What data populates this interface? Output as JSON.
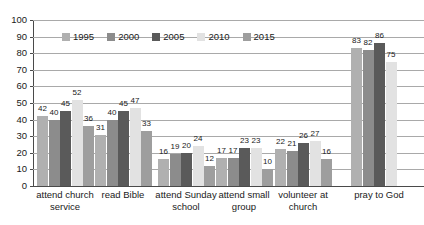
{
  "chart_data": {
    "type": "bar",
    "title": "",
    "subtitle": "",
    "xlabel": "",
    "ylabel": "",
    "ylim": [
      0,
      100
    ],
    "ytick_step": 10,
    "yticks": [
      "100",
      "90",
      "80",
      "70",
      "60",
      "50",
      "40",
      "30",
      "20",
      "10",
      "0"
    ],
    "grid": true,
    "legend_position": "top-inside-left",
    "categories": [
      "attend church service",
      "read Bible",
      "attend Sunday school",
      "attend small group",
      "volunteer at church",
      "pray to God"
    ],
    "series": [
      {
        "name": "1995",
        "color": "#b0b0b0",
        "values": [
          42,
          31,
          16,
          17,
          22,
          83
        ]
      },
      {
        "name": "2000",
        "color": "#8c8c8c",
        "values": [
          40,
          40,
          19,
          17,
          21,
          82
        ]
      },
      {
        "name": "2005",
        "color": "#5a5a5a",
        "values": [
          45,
          45,
          20,
          23,
          26,
          86
        ]
      },
      {
        "name": "2010",
        "color": "#e2e2e2",
        "values": [
          52,
          47,
          24,
          23,
          27,
          75
        ]
      },
      {
        "name": "2015",
        "color": "#9e9e9e",
        "values": [
          36,
          33,
          12,
          10,
          16,
          null
        ]
      }
    ]
  },
  "colors": {
    "background": "#ffffff",
    "gridline": "#a9a9a9",
    "axis": "#4a4a4a",
    "text": "#1a1a1a"
  }
}
